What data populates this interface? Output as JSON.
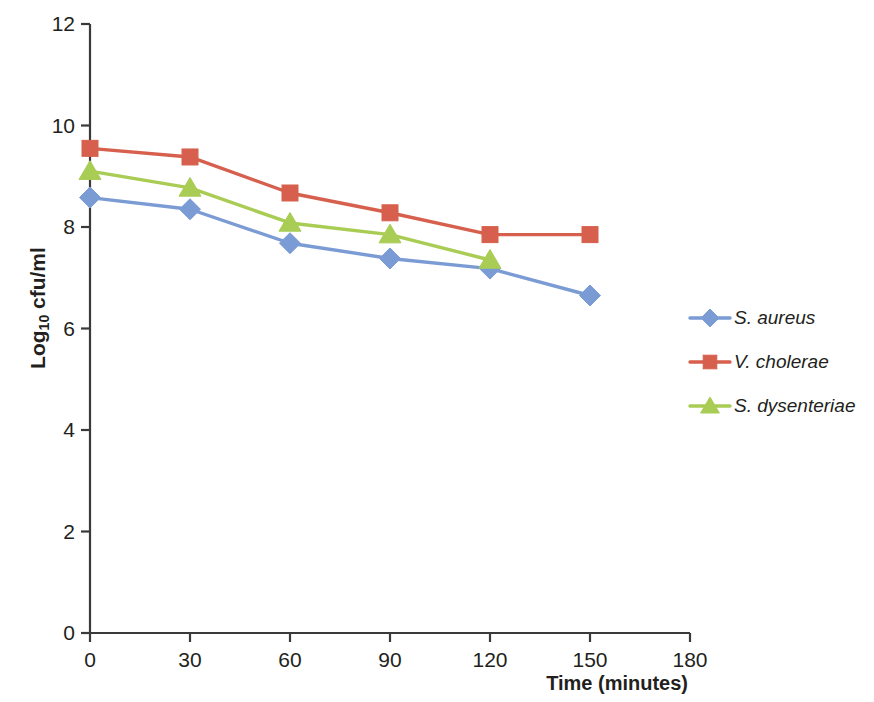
{
  "chart_data": {
    "type": "line",
    "title": "",
    "xlabel": "Time (minutes)",
    "ylabel": "Log10 cfu/ml",
    "ylabel_base": "Log",
    "ylabel_sub": "10",
    "ylabel_rest": " cfu/ml",
    "x": [
      0,
      30,
      60,
      90,
      120,
      150
    ],
    "xlim": [
      0,
      180
    ],
    "ylim": [
      0,
      12
    ],
    "xticks": [
      "0",
      "30",
      "60",
      "90",
      "120",
      "150",
      "180"
    ],
    "xtick_values": [
      0,
      30,
      60,
      90,
      120,
      150,
      180
    ],
    "yticks": [
      "0",
      "2",
      "4",
      "6",
      "8",
      "10",
      "12"
    ],
    "ytick_values": [
      0,
      2,
      4,
      6,
      8,
      10,
      12
    ],
    "grid": false,
    "legend_position": "right",
    "series": [
      {
        "name": "S. aureus",
        "color": "#7B9BD5",
        "marker": "diamond",
        "x": [
          0,
          30,
          60,
          90,
          120,
          150
        ],
        "values": [
          8.58,
          8.35,
          7.68,
          7.38,
          7.18,
          6.65
        ]
      },
      {
        "name": "V. cholerae",
        "color": "#D6604D",
        "marker": "square",
        "x": [
          0,
          30,
          60,
          90,
          120,
          150
        ],
        "values": [
          9.55,
          9.38,
          8.67,
          8.28,
          7.85,
          7.85
        ]
      },
      {
        "name": "S. dysenteriae",
        "color": "#A9CC54",
        "marker": "triangle",
        "x": [
          0,
          30,
          60,
          90,
          120
        ],
        "values": [
          9.1,
          8.77,
          8.08,
          7.85,
          7.35
        ]
      }
    ]
  },
  "axes": {
    "axis_color": "#3a3a3a",
    "text_color": "#231f20"
  }
}
